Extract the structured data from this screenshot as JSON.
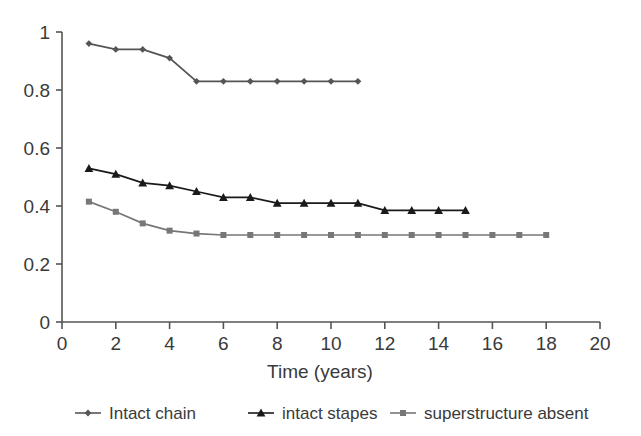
{
  "chart_data": {
    "type": "line",
    "title": "",
    "xlabel": "Time (years)",
    "ylabel": "",
    "xlim": [
      0,
      20
    ],
    "ylim": [
      0,
      1
    ],
    "grid": false,
    "legend_position": "bottom",
    "xticks": [
      "0",
      "2",
      "4",
      "6",
      "8",
      "10",
      "12",
      "14",
      "16",
      "18",
      "20"
    ],
    "xtick_values": [
      0,
      2,
      4,
      6,
      8,
      10,
      12,
      14,
      16,
      18,
      20
    ],
    "yticks": [
      "0",
      "0.2",
      "0.4",
      "0.6",
      "0.8",
      "1"
    ],
    "ytick_values": [
      0,
      0.2,
      0.4,
      0.6,
      0.8,
      1
    ],
    "series": [
      {
        "name": "Intact chain",
        "marker": "diamond",
        "color": "#555555",
        "x": [
          1,
          2,
          3,
          4,
          5,
          6,
          7,
          8,
          9,
          10,
          11
        ],
        "values": [
          0.96,
          0.94,
          0.94,
          0.91,
          0.83,
          0.83,
          0.83,
          0.83,
          0.83,
          0.83,
          0.83
        ]
      },
      {
        "name": "intact stapes",
        "marker": "triangle",
        "color": "#1a1a1a",
        "x": [
          1,
          2,
          3,
          4,
          5,
          6,
          7,
          8,
          9,
          10,
          11,
          12,
          13,
          14,
          15
        ],
        "values": [
          0.53,
          0.51,
          0.48,
          0.47,
          0.45,
          0.43,
          0.43,
          0.41,
          0.41,
          0.41,
          0.41,
          0.385,
          0.385,
          0.385,
          0.385
        ]
      },
      {
        "name": "superstructure absent",
        "marker": "square",
        "color": "#777777",
        "x": [
          1,
          2,
          3,
          4,
          5,
          6,
          7,
          8,
          9,
          10,
          11,
          12,
          13,
          14,
          15,
          16,
          17,
          18
        ],
        "values": [
          0.415,
          0.38,
          0.34,
          0.315,
          0.305,
          0.3,
          0.3,
          0.3,
          0.3,
          0.3,
          0.3,
          0.3,
          0.3,
          0.3,
          0.3,
          0.3,
          0.3,
          0.3
        ]
      }
    ]
  },
  "legend": {
    "items": [
      {
        "label": "Intact chain",
        "marker": "diamond",
        "color": "#555555"
      },
      {
        "label": "intact stapes",
        "marker": "triangle",
        "color": "#1a1a1a"
      },
      {
        "label": "superstructure absent",
        "marker": "square",
        "color": "#777777"
      }
    ]
  },
  "axes": {
    "x_title": "Time (years)"
  }
}
